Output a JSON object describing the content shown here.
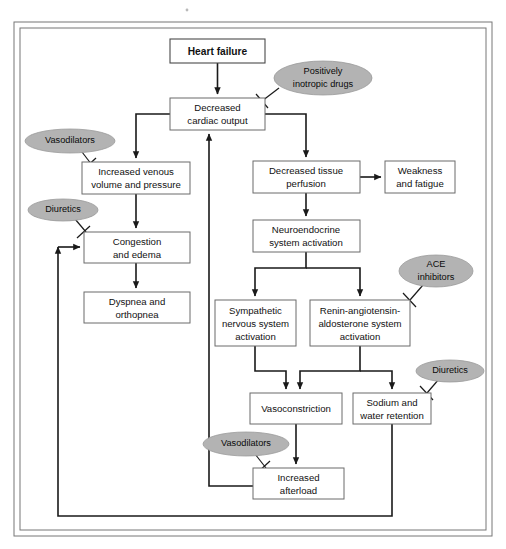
{
  "figure": {
    "frame_color": "#777777",
    "oval_fill": "#b3b3b3",
    "line_color": "#1a1a1a",
    "box_stroke": "#6b6b6b"
  },
  "nodes": {
    "heart_failure": {
      "label": "Heart failure",
      "x": 170,
      "y": 39,
      "w": 95,
      "h": 24
    },
    "decreased_cardiac_output": {
      "line1": "Decreased",
      "line2": "cardiac output",
      "x": 170,
      "y": 98,
      "w": 95,
      "h": 32
    },
    "increased_venous": {
      "line1": "Increased venous",
      "line2": "volume and pressure",
      "x": 82,
      "y": 162,
      "w": 108,
      "h": 32
    },
    "congestion": {
      "line1": "Congestion",
      "line2": "and edema",
      "x": 84,
      "y": 232,
      "w": 106,
      "h": 31
    },
    "dyspnea": {
      "line1": "Dyspnea and",
      "line2": "orthopnea",
      "x": 84,
      "y": 292,
      "w": 106,
      "h": 31
    },
    "decreased_tissue_perfusion": {
      "line1": "Decreased tissue",
      "line2": "perfusion",
      "x": 253,
      "y": 161,
      "w": 107,
      "h": 32
    },
    "weakness": {
      "line1": "Weakness",
      "line2": "and fatigue",
      "x": 385,
      "y": 161,
      "w": 70,
      "h": 32
    },
    "neuroendocrine": {
      "line1": "Neuroendocrine",
      "line2": "system activation",
      "x": 253,
      "y": 220,
      "w": 107,
      "h": 32
    },
    "sympathetic": {
      "line1": "Sympathetic",
      "line2": "nervous system",
      "line3": "activation",
      "x": 215,
      "y": 300,
      "w": 81,
      "h": 46
    },
    "renin": {
      "line1": "Renin-angiotensin-",
      "line2": "aldosterone system",
      "line3": "activation",
      "x": 310,
      "y": 300,
      "w": 100,
      "h": 46
    },
    "vasoconstriction": {
      "label": "Vasoconstriction",
      "x": 250,
      "y": 393,
      "w": 92,
      "h": 31
    },
    "sodium_water": {
      "line1": "Sodium and",
      "line2": "water retention",
      "x": 353,
      "y": 393,
      "w": 78,
      "h": 31
    },
    "increased_afterload": {
      "line1": "Increased",
      "line2": "afterload",
      "x": 253,
      "y": 468,
      "w": 91,
      "h": 31
    }
  },
  "ovals": {
    "positively_inotropic": {
      "line1": "Positively",
      "line2": "inotropic drugs",
      "cx": 323,
      "cy": 78,
      "rx": 49,
      "ry": 17
    },
    "vasodilators_top": {
      "label": "Vasodilators",
      "cx": 70,
      "cy": 141,
      "rx": 45,
      "ry": 12
    },
    "diuretics_left": {
      "label": "Diuretics",
      "cx": 63,
      "cy": 210,
      "rx": 35,
      "ry": 11
    },
    "ace_inhibitors": {
      "line1": "ACE",
      "line2": "inhibitors",
      "cx": 436,
      "cy": 271,
      "rx": 37,
      "ry": 16
    },
    "diuretics_right": {
      "label": "Diuretics",
      "cx": 450,
      "cy": 371,
      "rx": 34,
      "ry": 11
    },
    "vasodilators_bottom": {
      "label": "Vasodilators",
      "cx": 246,
      "cy": 444,
      "rx": 43,
      "ry": 12
    }
  },
  "connections": [
    {
      "name": "heart-failure-to-cardiac-output",
      "from": "heart_failure",
      "to": "decreased_cardiac_output"
    },
    {
      "name": "cardiac-output-to-venous-volume",
      "from": "decreased_cardiac_output",
      "to": "increased_venous"
    },
    {
      "name": "cardiac-output-to-tissue-perfusion",
      "from": "decreased_cardiac_output",
      "to": "decreased_tissue_perfusion"
    },
    {
      "name": "venous-volume-to-congestion",
      "from": "increased_venous",
      "to": "congestion"
    },
    {
      "name": "congestion-to-dyspnea",
      "from": "congestion",
      "to": "dyspnea"
    },
    {
      "name": "tissue-perfusion-to-weakness",
      "from": "decreased_tissue_perfusion",
      "to": "weakness"
    },
    {
      "name": "tissue-perfusion-to-neuroendocrine",
      "from": "decreased_tissue_perfusion",
      "to": "neuroendocrine"
    },
    {
      "name": "neuroendocrine-to-sympathetic",
      "from": "neuroendocrine",
      "to": "sympathetic"
    },
    {
      "name": "neuroendocrine-to-renin",
      "from": "neuroendocrine",
      "to": "renin"
    },
    {
      "name": "sympathetic-to-vasoconstriction",
      "from": "sympathetic",
      "to": "vasoconstriction"
    },
    {
      "name": "renin-to-vasoconstriction",
      "from": "renin",
      "to": "vasoconstriction"
    },
    {
      "name": "renin-to-sodium-water",
      "from": "renin",
      "to": "sodium_water"
    },
    {
      "name": "vasoconstriction-to-afterload",
      "from": "vasoconstriction",
      "to": "increased_afterload"
    },
    {
      "name": "afterload-to-cardiac-output",
      "from": "increased_afterload",
      "to": "decreased_cardiac_output"
    },
    {
      "name": "sodium-water-to-congestion",
      "from": "sodium_water",
      "to": "congestion"
    }
  ],
  "inhibitions": [
    {
      "name": "inotropic-inhibits-cardiac-output",
      "drug": "positively_inotropic",
      "target": "decreased_cardiac_output"
    },
    {
      "name": "vasodilators-inhibit-venous-volume",
      "drug": "vasodilators_top",
      "target": "increased_venous"
    },
    {
      "name": "diuretics-inhibit-congestion",
      "drug": "diuretics_left",
      "target": "congestion"
    },
    {
      "name": "ace-inhibits-renin",
      "drug": "ace_inhibitors",
      "target": "renin"
    },
    {
      "name": "diuretics-inhibit-sodium-water",
      "drug": "diuretics_right",
      "target": "sodium_water"
    },
    {
      "name": "vasodilators-inhibit-afterload",
      "drug": "vasodilators_bottom",
      "target": "increased_afterload"
    }
  ]
}
